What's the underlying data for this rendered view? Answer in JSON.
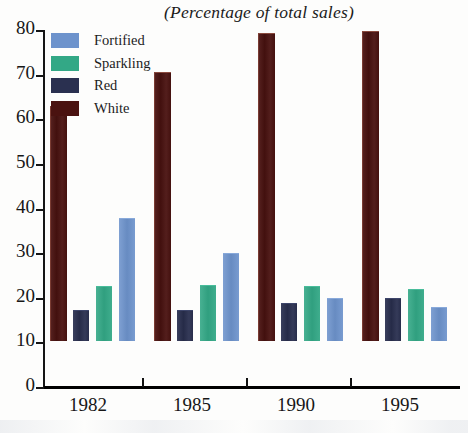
{
  "chart_data": {
    "type": "bar",
    "title": "(Percentage of total sales)",
    "xlabel": "",
    "ylabel": "",
    "categories": [
      "1982",
      "1985",
      "1990",
      "1995"
    ],
    "series": [
      {
        "name": "White",
        "color": "#4a1210",
        "values": [
          52.5,
          60.0,
          68.8,
          69.3
        ]
      },
      {
        "name": "Red",
        "color": "#2a3050",
        "values": [
          6.8,
          6.8,
          8.3,
          9.5
        ]
      },
      {
        "name": "Sparkling",
        "color": "#33a886",
        "values": [
          12.0,
          12.3,
          12.0,
          11.5
        ]
      },
      {
        "name": "Fortified",
        "color": "#6d93cc",
        "values": [
          27.3,
          19.5,
          9.5,
          7.5
        ]
      }
    ],
    "bar_order": [
      "White",
      "Red",
      "Sparkling",
      "Fortified"
    ],
    "ylim": [
      0,
      80
    ],
    "ytick_values": [
      80,
      70,
      60,
      50,
      40,
      30,
      20,
      10,
      0
    ],
    "ytick_labels": [
      "80",
      "70",
      "60",
      "50",
      "40",
      "30",
      "20",
      "10",
      "0"
    ],
    "grid": false,
    "legend_position": "top-left",
    "legend_order": [
      "Fortified",
      "Sparkling",
      "Red",
      "White"
    ]
  },
  "legend": {
    "items": [
      {
        "label": "Fortified",
        "color": "#6d93cc"
      },
      {
        "label": "Sparkling",
        "color": "#33a886"
      },
      {
        "label": "Red",
        "color": "#2a3050"
      },
      {
        "label": "White",
        "color": "#4a1210"
      }
    ]
  }
}
